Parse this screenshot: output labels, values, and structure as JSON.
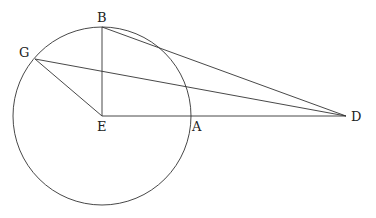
{
  "diagram": {
    "type": "geometry",
    "circle": {
      "center": "E",
      "cx": 102,
      "cy": 116,
      "r": 89
    },
    "points": {
      "B": {
        "x": 102,
        "y": 27,
        "label": "B"
      },
      "G": {
        "x": 35,
        "y": 59,
        "label": "G"
      },
      "E": {
        "x": 102,
        "y": 116,
        "label": "E"
      },
      "A": {
        "x": 190,
        "y": 116,
        "label": "A"
      },
      "D": {
        "x": 346,
        "y": 116,
        "label": "D"
      }
    },
    "segments": [
      [
        "B",
        "E"
      ],
      [
        "G",
        "E"
      ],
      [
        "E",
        "D"
      ],
      [
        "B",
        "D"
      ],
      [
        "G",
        "D"
      ]
    ],
    "labels": {
      "B": "B",
      "G": "G",
      "E": "E",
      "A": "A",
      "D": "D"
    }
  }
}
